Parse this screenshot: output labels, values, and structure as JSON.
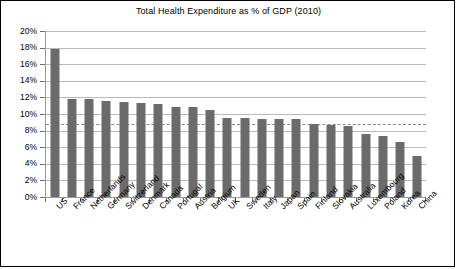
{
  "chart_data": {
    "type": "bar",
    "title": "Total Health Expenditure as % of GDP (2010)",
    "xlabel": "",
    "ylabel": "",
    "ylim": [
      0,
      20
    ],
    "ytick_labels": [
      "20%",
      "18%",
      "16%",
      "14%",
      "12%",
      "10%",
      "8%",
      "6%",
      "4%",
      "2%",
      "0%"
    ],
    "ytick_values": [
      20,
      18,
      16,
      14,
      12,
      10,
      8,
      6,
      4,
      2,
      0
    ],
    "grid": "horizontal",
    "legend": "none",
    "bar_color": "#6b6b6b",
    "gridline_color": "#b9b9b9",
    "axis_color": "#9a9a9a",
    "reference_line": {
      "value": 8.8,
      "style": "dashed",
      "color": "#8a8a8a"
    },
    "categories": [
      "US",
      "France",
      "Netherlands",
      "Germany",
      "Switzerland",
      "Denmark",
      "Canada",
      "Portugal",
      "Austria",
      "Belgium",
      "UK",
      "Sweden",
      "Italy",
      "Japan",
      "Spain",
      "Finland",
      "Slovakia",
      "Australia",
      "Luxembourg",
      "Poland",
      "Korea",
      "China"
    ],
    "values": [
      17.8,
      11.75,
      11.75,
      11.55,
      11.45,
      11.3,
      11.15,
      10.85,
      10.85,
      10.5,
      9.5,
      9.5,
      9.4,
      9.4,
      9.4,
      8.8,
      8.65,
      8.5,
      7.55,
      7.35,
      6.65,
      4.9
    ]
  }
}
